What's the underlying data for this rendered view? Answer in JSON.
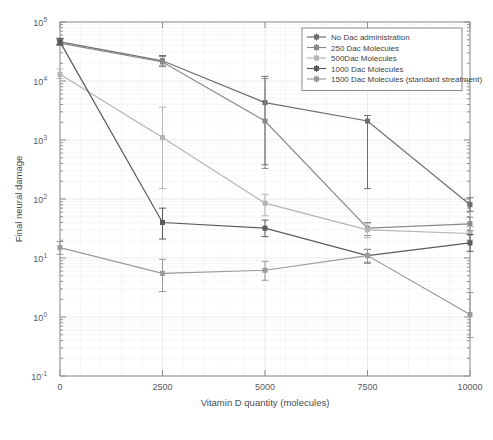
{
  "chart_data": {
    "type": "line",
    "title": "",
    "xlabel": "Vitamin D quantity (molecules)",
    "ylabel": "Final neural damage",
    "x": [
      0,
      2500,
      5000,
      7500,
      10000
    ],
    "xlim": [
      0,
      10000
    ],
    "ylim": [
      0.1,
      100000
    ],
    "yscale": "log",
    "xscale": "linear",
    "grid": true,
    "legend_position": "top-right",
    "xticklabels": [
      "0",
      "2500",
      "5000",
      "7500",
      "10000"
    ],
    "yticklabels": [
      "10^-1",
      "10^0",
      "10^1",
      "10^2",
      "10^3",
      "10^4",
      "10^5"
    ],
    "ytickvalues": [
      0.1,
      1,
      10,
      100,
      1000,
      10000,
      100000
    ],
    "series": [
      {
        "name": "No Dac administration",
        "color": "#6e6e6e",
        "values": [
          46000,
          22000,
          4300,
          2100,
          80
        ],
        "err_low": [
          42000,
          18000,
          380,
          150,
          62
        ],
        "err_high": [
          52000,
          27000,
          12000,
          2600,
          105
        ]
      },
      {
        "name": "250 Dac Molecules",
        "color": "#8a8a8a",
        "values": [
          44000,
          21000,
          2100,
          32,
          38
        ],
        "err_low": [
          40000,
          17500,
          330,
          24,
          29
        ],
        "err_high": [
          50000,
          26000,
          11000,
          40,
          49
        ]
      },
      {
        "name": "500Dac Molecules",
        "color": "#b4b4b4",
        "values": [
          13000,
          1100,
          85,
          30,
          26
        ],
        "err_low": [
          11000,
          150,
          52,
          22,
          20
        ],
        "err_high": [
          16000,
          3600,
          120,
          38,
          34
        ]
      },
      {
        "name": "1000 Dac Molecules",
        "color": "#5a5a5a",
        "values": [
          46000,
          40,
          32,
          11,
          18
        ],
        "err_low": [
          41000,
          21,
          23,
          8.2,
          13
        ],
        "err_high": [
          53000,
          70,
          44,
          14,
          25
        ]
      },
      {
        "name": "1500  Dac Molecules (standard streatment)",
        "color": "#9a9a9a",
        "values": [
          15,
          5.5,
          6.2,
          11,
          1.1
        ],
        "err_low": [
          11.5,
          2.7,
          4.2,
          8.5,
          0.45
        ],
        "err_high": [
          19,
          9.5,
          8.8,
          14,
          2.6
        ]
      }
    ]
  },
  "axes": {
    "ylabel": "Final neural damage",
    "xlabel": "Vitamin D quantity (molecules)"
  },
  "legend": {
    "items": [
      {
        "label": "No Dac administration"
      },
      {
        "label": "250 Dac Molecules"
      },
      {
        "label": "500Dac Molecules"
      },
      {
        "label": "1000 Dac Molecules"
      },
      {
        "label": "1500  Dac Molecules (standard streatment)"
      }
    ]
  },
  "ticks": {
    "x": [
      "0",
      "2500",
      "5000",
      "7500",
      "10000"
    ],
    "y_mantissa": [
      "10",
      "10",
      "10",
      "10",
      "10",
      "10",
      "10"
    ],
    "y_exponent": [
      "5",
      "4",
      "3",
      "2",
      "1",
      "0",
      "-1"
    ]
  }
}
